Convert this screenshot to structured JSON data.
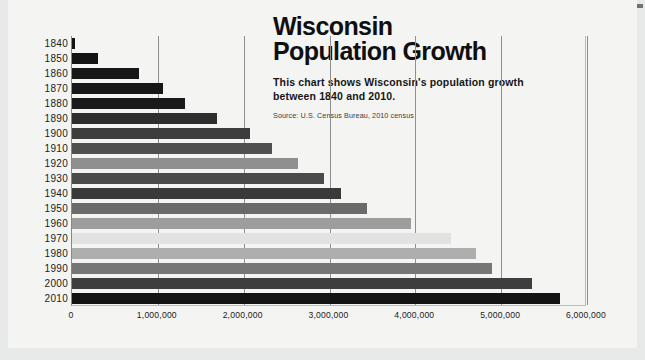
{
  "header": {
    "title": "Wisconsin\nPopulation Growth",
    "subtitle": "This chart shows Wisconsin's population growth\nbetween 1840 and 2010.",
    "source": "Source: U.S. Census Bureau, 2010 census"
  },
  "colors": {
    "page_background": "#e8e9e9",
    "card_background": "#f4f4f3",
    "title": "#100f0f",
    "gridline": "#8d9091",
    "axis": "#86898a",
    "corner_mark": "#6e7273"
  },
  "chart_data": {
    "type": "bar",
    "orientation": "horizontal",
    "title": "Wisconsin Population Growth",
    "subtitle": "This chart shows Wisconsin's population growth between 1840 and 2010.",
    "source": "Source: U.S. Census Bureau, 2010 census",
    "xlabel": "",
    "ylabel": "",
    "xlim": [
      0,
      6000000
    ],
    "grid": true,
    "legend": false,
    "xticks": [
      0,
      1000000,
      2000000,
      3000000,
      4000000,
      5000000,
      6000000
    ],
    "xticklabels": [
      "0",
      "1,000,000",
      "2,000,000",
      "3,000,000",
      "4,000,000",
      "5,000,000",
      "6,000,000"
    ],
    "categories": [
      "1840",
      "1850",
      "1860",
      "1870",
      "1880",
      "1890",
      "1900",
      "1910",
      "1920",
      "1930",
      "1940",
      "1950",
      "1960",
      "1970",
      "1980",
      "1990",
      "2000",
      "2010"
    ],
    "values": [
      30945,
      305391,
      775881,
      1054670,
      1315497,
      1693330,
      2069042,
      2333860,
      2632067,
      2939006,
      3137587,
      3434575,
      3952771,
      4417731,
      4705767,
      4891769,
      5363675,
      5686986
    ],
    "bar_colors": [
      "#141414",
      "#141414",
      "#171717",
      "#171717",
      "#1a1a1a",
      "#2e2e2e",
      "#3d3d3d",
      "#4f4f4f",
      "#8f8f8f",
      "#4b4b4b",
      "#3a3a3a",
      "#6a6a6a",
      "#9d9d9d",
      "#e2e2e2",
      "#aeaeae",
      "#767676",
      "#3e3e3e",
      "#141414"
    ]
  }
}
